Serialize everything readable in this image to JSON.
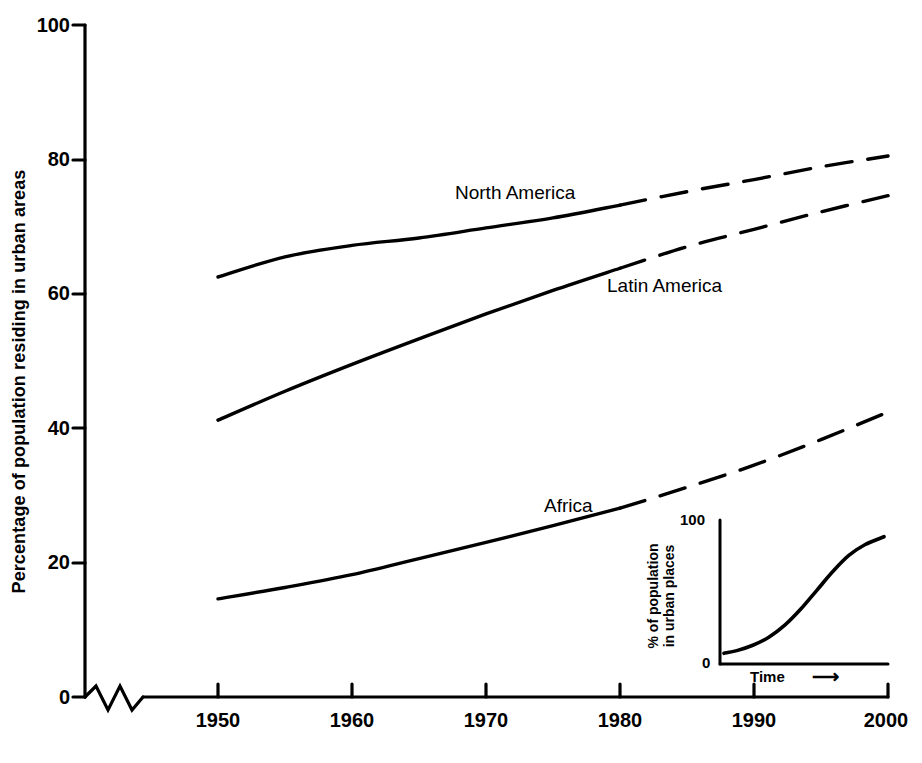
{
  "chart_data": {
    "type": "line",
    "title": "",
    "xlabel": "",
    "ylabel": "Percentage of population residing in urban areas",
    "xlim": [
      1950,
      2000
    ],
    "ylim": [
      0,
      100
    ],
    "grid": false,
    "legend_position": "inline-labels",
    "axis_break": "zigzag break on x-axis between 0 and 1950",
    "x_ticks": [
      "1950",
      "1960",
      "1970",
      "1980",
      "1990",
      "2000"
    ],
    "y_ticks": [
      "0",
      "20",
      "40",
      "60",
      "80",
      "100"
    ],
    "x": [
      1950,
      1955,
      1960,
      1965,
      1970,
      1975,
      1980,
      1985,
      1990,
      1995,
      2000
    ],
    "observed_through": 1980,
    "projected_from": 1980,
    "series": [
      {
        "name": "North America",
        "label": "North America",
        "style": "solid-then-dashed",
        "values": [
          62.5,
          65.5,
          67.2,
          68.3,
          69.8,
          71.3,
          73.2,
          75.2,
          77.0,
          78.9,
          80.5
        ]
      },
      {
        "name": "Latin America",
        "label": "Latin America",
        "style": "solid-then-dashed",
        "values": [
          41.2,
          45.5,
          49.5,
          53.3,
          57.0,
          60.5,
          63.8,
          67.0,
          69.6,
          72.2,
          74.6
        ]
      },
      {
        "name": "Africa",
        "label": "Africa",
        "style": "solid-then-dashed",
        "values": [
          14.6,
          16.3,
          18.2,
          20.6,
          23.0,
          25.5,
          28.1,
          31.2,
          34.5,
          38.3,
          42.4
        ]
      }
    ]
  },
  "inset_chart": {
    "type": "line",
    "ylabel_line1": "% of population",
    "ylabel_line2": "in urban places",
    "xlabel": "Time",
    "xlabel_arrow": "⟶",
    "y_ticks": [
      "0",
      "100"
    ],
    "ylim": [
      0,
      100
    ],
    "curve_shape": "logistic S-curve",
    "x": [
      0,
      0.08,
      0.18,
      0.28,
      0.38,
      0.48,
      0.58,
      0.68,
      0.78,
      0.88,
      1.0
    ],
    "values": [
      5,
      7,
      11,
      17,
      26,
      38,
      52,
      66,
      78,
      86,
      92
    ]
  },
  "series_labels": [
    {
      "text": "North America"
    },
    {
      "text": "Latin America"
    },
    {
      "text": "Africa"
    }
  ],
  "colors": {
    "background": "#ffffff",
    "ink": "#000000"
  }
}
